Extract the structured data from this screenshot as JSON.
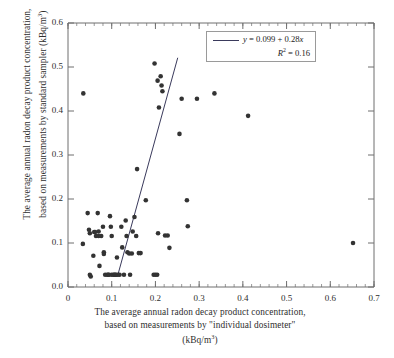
{
  "chart_data": {
    "type": "scatter",
    "title": "",
    "xlabel": "The average annual radon decay product concentration, based on measurements by \"individual dosimeter\" (kBq/m3)",
    "ylabel": "The average annual radon decay product concentration, based on measurements by standard sampler (kBq/m3)",
    "xlim": [
      0,
      0.7
    ],
    "ylim": [
      0.0,
      0.6
    ],
    "xticks": [
      "0",
      "0.1",
      "0.2",
      "0.3",
      "0.4",
      "0.5",
      "0.6",
      "0.7"
    ],
    "yticks": [
      "0.0",
      "0.1",
      "0.2",
      "0.3",
      "0.4",
      "0.5",
      "0.6"
    ],
    "xtick_values": [
      0,
      0.1,
      0.2,
      0.3,
      0.4,
      0.5,
      0.6,
      0.7
    ],
    "ytick_values": [
      0.0,
      0.1,
      0.2,
      0.3,
      0.4,
      0.5,
      0.6
    ],
    "minor_ticks": true,
    "grid": false,
    "legend_position": "top-right",
    "marker_color": "#333333",
    "line_color": "#3a3a5c",
    "points": [
      [
        0.034,
        0.098
      ],
      [
        0.035,
        0.44
      ],
      [
        0.045,
        0.168
      ],
      [
        0.048,
        0.13
      ],
      [
        0.05,
        0.122
      ],
      [
        0.05,
        0.028
      ],
      [
        0.052,
        0.024
      ],
      [
        0.058,
        0.071
      ],
      [
        0.06,
        0.125
      ],
      [
        0.062,
        0.125
      ],
      [
        0.064,
        0.116
      ],
      [
        0.068,
        0.168
      ],
      [
        0.07,
        0.126
      ],
      [
        0.07,
        0.116
      ],
      [
        0.072,
        0.048
      ],
      [
        0.076,
        0.116
      ],
      [
        0.08,
        0.137
      ],
      [
        0.082,
        0.079
      ],
      [
        0.082,
        0.075
      ],
      [
        0.085,
        0.028
      ],
      [
        0.09,
        0.028
      ],
      [
        0.092,
        0.028
      ],
      [
        0.094,
        0.028
      ],
      [
        0.096,
        0.161
      ],
      [
        0.098,
        0.137
      ],
      [
        0.1,
        0.116
      ],
      [
        0.1,
        0.028
      ],
      [
        0.104,
        0.028
      ],
      [
        0.106,
        0.028
      ],
      [
        0.108,
        0.028
      ],
      [
        0.11,
        0.028
      ],
      [
        0.112,
        0.067
      ],
      [
        0.114,
        0.028
      ],
      [
        0.118,
        0.028
      ],
      [
        0.122,
        0.137
      ],
      [
        0.124,
        0.09
      ],
      [
        0.128,
        0.028
      ],
      [
        0.132,
        0.151
      ],
      [
        0.134,
        0.116
      ],
      [
        0.136,
        0.079
      ],
      [
        0.14,
        0.076
      ],
      [
        0.142,
        0.028
      ],
      [
        0.146,
        0.076
      ],
      [
        0.148,
        0.126
      ],
      [
        0.152,
        0.159
      ],
      [
        0.156,
        0.116
      ],
      [
        0.158,
        0.268
      ],
      [
        0.162,
        0.077
      ],
      [
        0.166,
        0.077
      ],
      [
        0.178,
        0.197
      ],
      [
        0.196,
        0.028
      ],
      [
        0.198,
        0.508
      ],
      [
        0.2,
        0.028
      ],
      [
        0.204,
        0.028
      ],
      [
        0.205,
        0.469
      ],
      [
        0.206,
        0.122
      ],
      [
        0.208,
        0.408
      ],
      [
        0.212,
        0.479
      ],
      [
        0.214,
        0.458
      ],
      [
        0.216,
        0.445
      ],
      [
        0.222,
        0.117
      ],
      [
        0.228,
        0.117
      ],
      [
        0.232,
        0.089
      ],
      [
        0.255,
        0.348
      ],
      [
        0.26,
        0.428
      ],
      [
        0.272,
        0.197
      ],
      [
        0.274,
        0.138
      ],
      [
        0.295,
        0.428
      ],
      [
        0.335,
        0.44
      ],
      [
        0.412,
        0.389
      ],
      [
        0.652,
        0.1
      ]
    ],
    "regression": {
      "equation": "y = 0.099 + 0.28x",
      "intercept": 0.099,
      "slope": 0.28,
      "r_squared_label": "R2 = 0.16",
      "r_squared": 0.16,
      "segment": {
        "x0": 0.115,
        "y0": 0.031,
        "x1": 0.251,
        "y1": 0.521
      }
    },
    "legend": {
      "equation_prefix": "y",
      "equation_text": " = 0.099 + 0.28",
      "equation_var": "x",
      "r_label": "R",
      "r_exp": "2",
      "r_value": " = 0.16"
    }
  },
  "axis_labels": {
    "x_line1": "The average annual radon decay product concentration,",
    "x_line2": "based on measurements by \"individual dosimeter\"",
    "x_line3_pre": "(kBq/m",
    "x_line3_sup": "3",
    "x_line3_post": ")",
    "y_line1": "The average annual radon decay product concentration,",
    "y_line2_pre": "based on measurements by standard sampler  (kBq/m",
    "y_line2_sup": "3",
    "y_line2_post": ")"
  }
}
